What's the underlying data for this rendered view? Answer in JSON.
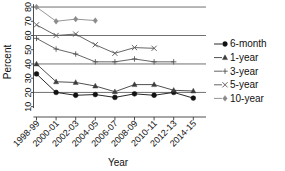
{
  "chart_data": {
    "type": "line",
    "title": "",
    "xlabel": "Year",
    "ylabel": "Percent",
    "categories": [
      "1998-99",
      "2000-01",
      "2002-03",
      "2004-05",
      "2006-07",
      "2008-09",
      "2010-11",
      "2012-13",
      "2014-15"
    ],
    "ylim": [
      8,
      82
    ],
    "yticks": [
      10,
      20,
      30,
      40,
      50,
      60,
      70,
      80
    ],
    "ytick_labels": [
      "10",
      "20",
      "30",
      "40",
      "50",
      "60",
      "70",
      "80"
    ],
    "gridlines": [
      20,
      40,
      60,
      80
    ],
    "grid": true,
    "legend_position": "right",
    "series": [
      {
        "name": "6-month",
        "marker": "circle",
        "color": "#111111",
        "values": [
          33,
          20,
          18,
          18.5,
          16.5,
          19,
          18,
          20,
          16
        ]
      },
      {
        "name": "1-year",
        "marker": "triangle",
        "color": "#3c3c3c",
        "values": [
          40,
          27.5,
          27,
          24.5,
          20.5,
          25.5,
          25.5,
          21.5,
          21
        ]
      },
      {
        "name": "3-year",
        "marker": "plus",
        "color": "#555555",
        "values": [
          58,
          50.5,
          47,
          41.5,
          41.5,
          43.5,
          41.5,
          41.5,
          null
        ]
      },
      {
        "name": "5-year",
        "marker": "cross",
        "color": "#555555",
        "values": [
          67.5,
          60,
          61,
          53.5,
          47.5,
          51.5,
          51,
          null,
          null
        ]
      },
      {
        "name": "10-year",
        "marker": "diamond",
        "color": "#8a8a8a",
        "values": [
          80,
          70,
          71.5,
          70.5,
          null,
          null,
          null,
          null,
          null
        ]
      }
    ]
  },
  "axes": {
    "y_title": "Percent",
    "x_title": "Year"
  },
  "legend": {
    "items": [
      {
        "label": "6-month",
        "marker": "circle-marker"
      },
      {
        "label": "1-year",
        "marker": "triangle-marker"
      },
      {
        "label": "3-year",
        "marker": "plus-marker"
      },
      {
        "label": "5-year",
        "marker": "cross-marker"
      },
      {
        "label": "10-year",
        "marker": "diamond-marker"
      }
    ]
  }
}
